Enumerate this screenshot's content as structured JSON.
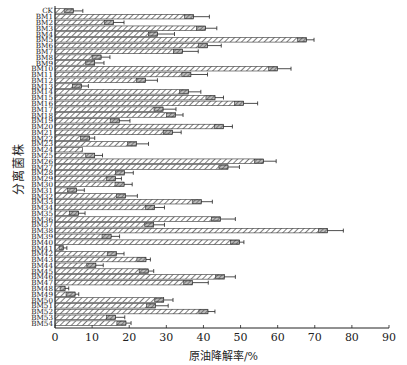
{
  "chart_data": {
    "type": "bar",
    "orientation": "horizontal",
    "title": "",
    "xlabel": "原油降解率/%",
    "ylabel": "分离菌株",
    "xlim": [
      0,
      90
    ],
    "xticks": [
      0,
      10,
      20,
      30,
      40,
      50,
      60,
      70,
      80,
      90
    ],
    "grid": false,
    "legend": null,
    "error_bars": true,
    "categories": [
      "CK",
      "BM1",
      "BM2",
      "BM3",
      "BM4",
      "BM5",
      "BM6",
      "BM7",
      "BM8",
      "BM9",
      "BM10",
      "BM11",
      "BM12",
      "BM13",
      "BM14",
      "BM15",
      "BM16",
      "BM17",
      "BM18",
      "BM19",
      "BM20",
      "BM21",
      "BM22",
      "BM23",
      "BM24",
      "BM25",
      "BM26",
      "BM27",
      "BM28",
      "BM29",
      "BM30",
      "BM31",
      "BM32",
      "BM33",
      "BM34",
      "BM35",
      "BM36",
      "BM37",
      "BM38",
      "BM39",
      "BM40",
      "BM41",
      "BM42",
      "BM43",
      "BM44",
      "BM45",
      "BM46",
      "BM47",
      "BM48",
      "BM49",
      "BM50",
      "BM51",
      "BM52",
      "BM53",
      "BM54"
    ],
    "values": [
      4.9,
      37.3,
      15.7,
      40.5,
      27.6,
      67.7,
      41.1,
      34.3,
      12.4,
      10.7,
      60.0,
      36.6,
      24.4,
      7.1,
      36.0,
      43.1,
      50.8,
      29.1,
      32.5,
      17.3,
      45.4,
      31.6,
      9.3,
      22.0,
      7.4,
      10.7,
      56.2,
      46.6,
      18.7,
      16.3,
      18.6,
      5.8,
      19.0,
      39.4,
      26.8,
      6.3,
      44.6,
      26.6,
      73.4,
      15.1,
      49.7,
      2.2,
      16.5,
      24.5,
      11.0,
      25.1,
      45.7,
      37.1,
      2.7,
      5.4,
      29.3,
      27.1,
      41.2,
      16.3,
      19.1
    ],
    "errors": [
      2.6,
      4.3,
      2.9,
      3.1,
      4.6,
      2.1,
      3.7,
      4.3,
      2.4,
      2.5,
      3.6,
      4.5,
      3.2,
      1.9,
      3.3,
      2.3,
      3.8,
      3.5,
      2.0,
      2.9,
      2.4,
      2.4,
      1.4,
      3.2,
      0,
      2.1,
      3.4,
      3.1,
      2.4,
      1.6,
      2.2,
      2.1,
      3.2,
      3.0,
      2.7,
      1.8,
      4.0,
      2.9,
      4.3,
      2.3,
      1.2,
      1.0,
      2.1,
      1.2,
      2.0,
      1.5,
      2.9,
      4.2,
      1.0,
      1.0,
      2.5,
      3.4,
      1.9,
      2.5,
      1.4
    ]
  }
}
